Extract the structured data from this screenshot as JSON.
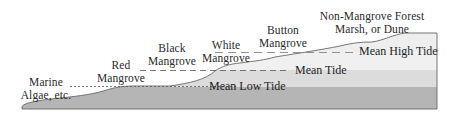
{
  "diagram": {
    "type": "mangrove-zonation-profile",
    "zones": [
      {
        "id": "marine-algae",
        "line1": "Marine",
        "line2": "Algae, etc."
      },
      {
        "id": "red-mangrove",
        "line1": "Red",
        "line2": "Mangrove"
      },
      {
        "id": "black-mangrove",
        "line1": "Black",
        "line2": "Mangrove"
      },
      {
        "id": "white-mangrove",
        "line1": "White",
        "line2": "Mangrove"
      },
      {
        "id": "button-mangrove",
        "line1": "Button",
        "line2": "Mangrove"
      },
      {
        "id": "non-mangrove",
        "line1": "Non-Mangrove Forest",
        "line2": "Marsh, or Dune"
      }
    ],
    "tide_levels": [
      {
        "id": "mean-high-tide",
        "label": "Mean High Tide"
      },
      {
        "id": "mean-tide",
        "label": "Mean Tide"
      },
      {
        "id": "mean-low-tide",
        "label": "Mean Low Tide"
      }
    ],
    "colors": {
      "band_low": "#b4b4b4",
      "band_mid": "#d8d8d8",
      "band_high": "#eeeeee",
      "outline": "#555555",
      "dash": "#555555",
      "text": "#222222"
    }
  }
}
